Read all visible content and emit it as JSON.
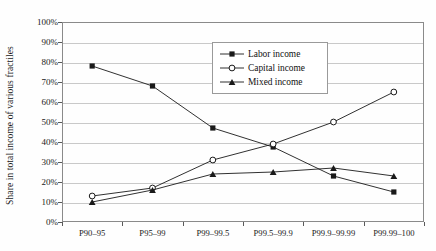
{
  "chart_data": {
    "type": "line",
    "title": "",
    "xlabel": "",
    "ylabel": "Share in total income of various fractiles",
    "categories": [
      "P90–95",
      "P95–99",
      "P99–99.5",
      "P99.5–99.9",
      "P99.9–99.99",
      "P99.99–100"
    ],
    "ylim": [
      0,
      100
    ],
    "yticks": [
      "0%",
      "10%",
      "20%",
      "30%",
      "40%",
      "50%",
      "60%",
      "70%",
      "80%",
      "90%",
      "100%"
    ],
    "ytick_values": [
      0,
      10,
      20,
      30,
      40,
      50,
      60,
      70,
      80,
      90,
      100
    ],
    "grid": true,
    "legend_position": "upper-center",
    "series": [
      {
        "name": "Labor income",
        "marker": "filled-square",
        "values": [
          78,
          68,
          47,
          37.5,
          23,
          15
        ]
      },
      {
        "name": "Capital income",
        "marker": "open-circle",
        "values": [
          13,
          17,
          31,
          39,
          50,
          65
        ]
      },
      {
        "name": "Mixed income",
        "marker": "filled-triangle",
        "values": [
          10,
          16,
          24,
          25,
          27,
          23
        ]
      }
    ]
  },
  "legend": {
    "items": [
      {
        "label": "Labor income",
        "marker": "filled-square-icon"
      },
      {
        "label": "Capital income",
        "marker": "open-circle-icon"
      },
      {
        "label": "Mixed income",
        "marker": "filled-triangle-icon"
      }
    ]
  },
  "colors": {
    "line": "#1a1a1a",
    "grid": "#c9c9c9",
    "frame": "#8a8a8a",
    "background": "#fefefe",
    "text": "#1a1a1a"
  }
}
